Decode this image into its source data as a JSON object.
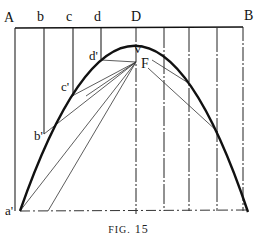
{
  "figure": {
    "caption_prefix": "FIG.",
    "caption_number": "15",
    "colors": {
      "ink": "#111111",
      "thin": "#444444",
      "background": "#ffffff"
    }
  },
  "labels": {
    "A": "A",
    "b": "b",
    "c": "c",
    "d": "d",
    "D": "D",
    "B": "B",
    "V": "V",
    "F": "F",
    "a_prime": "a'",
    "b_prime": "b'",
    "c_prime": "c'",
    "d_prime": "d'"
  },
  "geometry": {
    "top_line": {
      "from": "A",
      "to": "B"
    },
    "axis": "D",
    "vertex": "V",
    "focus": "F",
    "curve": "parabola",
    "curve_points_left": [
      "a'",
      "b'",
      "c'",
      "d'"
    ]
  }
}
